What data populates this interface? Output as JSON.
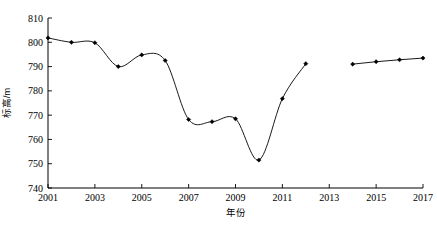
{
  "chart_data": {
    "type": "line",
    "title": "",
    "xlabel": "年份",
    "ylabel": "标高/m",
    "xlim": [
      2001,
      2017
    ],
    "ylim": [
      740,
      810
    ],
    "xticks": [
      "2001",
      "2003",
      "2005",
      "2007",
      "2009",
      "2011",
      "2013",
      "2015",
      "2017"
    ],
    "yticks": [
      "740",
      "750",
      "760",
      "770",
      "780",
      "790",
      "800",
      "810"
    ],
    "grid": false,
    "legend": "none",
    "marker": "filled-diamond",
    "line_color": "#000000",
    "series": [
      {
        "name": "segment-1",
        "x": [
          2001,
          2002,
          2003,
          2004,
          2005,
          2006,
          2007,
          2008,
          2009,
          2010,
          2011,
          2012
        ],
        "values": [
          801.8,
          800.0,
          799.8,
          790.0,
          794.8,
          792.5,
          768.2,
          767.3,
          768.5,
          751.5,
          776.8,
          791.2
        ]
      },
      {
        "name": "segment-2",
        "x": [
          2014,
          2015,
          2016,
          2017
        ],
        "values": [
          791.0,
          792.0,
          792.8,
          793.5
        ]
      }
    ]
  }
}
